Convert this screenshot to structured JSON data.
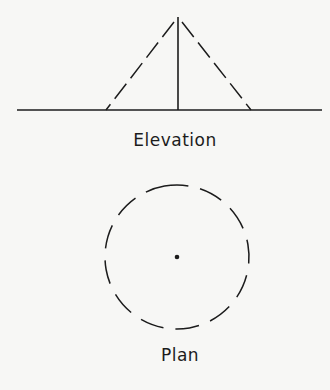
{
  "diagram": {
    "elevation": {
      "label": "Elevation",
      "ground_line": {
        "x1": 17,
        "x2": 322,
        "y": 110
      },
      "apex": {
        "x": 178,
        "y": 17
      },
      "left_base": {
        "x": 106,
        "y": 110
      },
      "right_base": {
        "x": 251,
        "y": 110
      },
      "center_post": {
        "x": 178,
        "y_top": 17,
        "y_bottom": 110
      },
      "slant_style": "dashed"
    },
    "plan": {
      "label": "Plan",
      "circle": {
        "cx": 177,
        "cy": 257,
        "r": 72,
        "style": "dashed"
      },
      "center_dot": {
        "cx": 177,
        "cy": 257,
        "r": 2.3
      }
    },
    "stroke_color": "#1c1c1c",
    "background_color": "#f7f7f5"
  }
}
